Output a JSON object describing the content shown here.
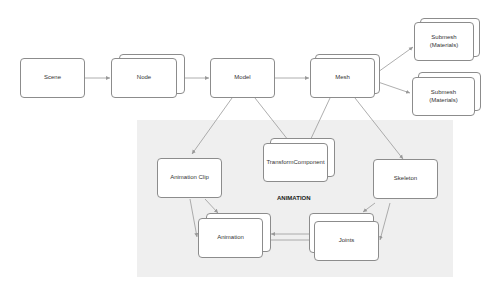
{
  "diagram": {
    "region_label": "ANIMATION",
    "nodes": {
      "scene": {
        "label": "Scene"
      },
      "node": {
        "label": "Node"
      },
      "model": {
        "label": "Model"
      },
      "mesh": {
        "label": "Mesh"
      },
      "submesh1": {
        "label": "Submesh\n(Materials)"
      },
      "submesh2": {
        "label": "Submesh\n(Materials)"
      },
      "transform": {
        "label": "TransformComponent"
      },
      "anim_clip": {
        "label": "Animation Clip"
      },
      "skeleton": {
        "label": "Skeleton"
      },
      "animation": {
        "label": "Animation"
      },
      "joints": {
        "label": "Joints"
      }
    },
    "edges": [
      {
        "from": "Scene",
        "to": "Node"
      },
      {
        "from": "Node",
        "to": "Model"
      },
      {
        "from": "Model",
        "to": "Mesh"
      },
      {
        "from": "Mesh",
        "to": "Submesh (Materials)"
      },
      {
        "from": "Mesh",
        "to": "Submesh (Materials)"
      },
      {
        "from": "Model",
        "to": "Animation Clip"
      },
      {
        "from": "Model",
        "to": "TransformComponent"
      },
      {
        "from": "Mesh",
        "to": "TransformComponent"
      },
      {
        "from": "Mesh",
        "to": "Skeleton"
      },
      {
        "from": "Animation Clip",
        "to": "Animation"
      },
      {
        "from": "Skeleton",
        "to": "Joints"
      },
      {
        "from": "Joints",
        "to": "Animation"
      }
    ],
    "colors": {
      "region": "#efefef",
      "border": "#8c8c8c",
      "edge": "#999999"
    }
  }
}
